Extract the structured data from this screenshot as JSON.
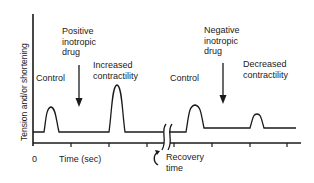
{
  "diagram": {
    "y_axis_label": "Tension and/or shortening",
    "x_axis_label": "Time (sec)",
    "x_origin_label": "0",
    "labels": {
      "control_1": "Control",
      "positive_drug_line1": "Positive",
      "positive_drug_line2": "inotropic",
      "positive_drug_line3": "drug",
      "increased_line1": "Increased",
      "increased_line2": "contractility",
      "control_2": "Control",
      "negative_drug_line1": "Negative",
      "negative_drug_line2": "inotropic",
      "negative_drug_line3": "drug",
      "decreased_line1": "Decreased",
      "decreased_line2": "contractility",
      "recovery_line1": "Recovery",
      "recovery_line2": "time"
    },
    "colors": {
      "line": "#1a1a1a",
      "background": "#ffffff"
    }
  }
}
